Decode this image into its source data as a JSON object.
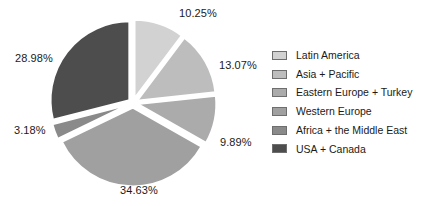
{
  "chart_data": {
    "type": "pie",
    "title": "",
    "subtitle": "",
    "xlabel": "",
    "ylabel": "",
    "grid": false,
    "legend_position": "right",
    "exploded": true,
    "value_unit": "%",
    "categories": [
      "Latin America",
      "Asia + Pacific",
      "Eastern Europe + Turkey",
      "Western Europe",
      "Africa + the Middle East",
      "USA + Canada"
    ],
    "values": [
      10.25,
      13.07,
      9.89,
      34.63,
      3.18,
      28.98
    ],
    "labels": [
      "10.25%",
      "13.07%",
      "9.89%",
      "34.63%",
      "3.18%",
      "28.98%"
    ],
    "colors": [
      "#d2d2d2",
      "#bdbdbd",
      "#ababab",
      "#a0a0a0",
      "#8a8a8a",
      "#4d4d4d"
    ],
    "slices": [
      {
        "name": "Latin America",
        "value": 10.25,
        "label": "10.25%",
        "color": "#d2d2d2",
        "start_angle": 0,
        "end_angle": 36.9
      },
      {
        "name": "Asia + Pacific",
        "value": 13.07,
        "label": "13.07%",
        "color": "#bdbdbd",
        "start_angle": 36.9,
        "end_angle": 83.952
      },
      {
        "name": "Eastern Europe + Turkey",
        "value": 9.89,
        "label": "9.89%",
        "color": "#ababab",
        "start_angle": 83.952,
        "end_angle": 119.556
      },
      {
        "name": "Western Europe",
        "value": 34.63,
        "label": "34.63%",
        "color": "#a0a0a0",
        "start_angle": 119.556,
        "end_angle": 244.224
      },
      {
        "name": "Africa + the Middle East",
        "value": 3.18,
        "label": "3.18%",
        "color": "#8a8a8a",
        "start_angle": 244.224,
        "end_angle": 255.672
      },
      {
        "name": "USA + Canada",
        "value": 28.98,
        "label": "28.98%",
        "color": "#4d4d4d",
        "start_angle": 255.672,
        "end_angle": 360
      }
    ]
  },
  "legend": {
    "items": [
      {
        "label": "Latin America",
        "color": "#d2d2d2"
      },
      {
        "label": "Asia + Pacific",
        "color": "#bdbdbd"
      },
      {
        "label": "Eastern Europe + Turkey",
        "color": "#ababab"
      },
      {
        "label": "Western Europe",
        "color": "#a0a0a0"
      },
      {
        "label": "Africa + the Middle East",
        "color": "#8a8a8a"
      },
      {
        "label": "USA + Canada",
        "color": "#4d4d4d"
      }
    ]
  },
  "labels_layout": [
    {
      "text": "10.25%",
      "left": 179,
      "top": 7
    },
    {
      "text": "13.07%",
      "left": 219,
      "top": 59
    },
    {
      "text": "9.89%",
      "left": 220,
      "top": 136
    },
    {
      "text": "34.63%",
      "left": 120,
      "top": 184
    },
    {
      "text": "3.18%",
      "left": 14,
      "top": 124
    },
    {
      "text": "28.98%",
      "left": 15,
      "top": 52
    }
  ]
}
